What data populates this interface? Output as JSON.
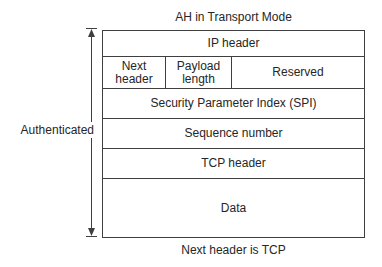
{
  "title": "AH in Transport Mode",
  "side_label": "Authenticated",
  "caption": "Next header is TCP",
  "packet": {
    "rows": {
      "ip_header": "IP header",
      "spi": "Security Parameter Index (SPI)",
      "sequence_number": "Sequence number",
      "tcp_header": "TCP header",
      "data": "Data"
    },
    "ah_fields": [
      {
        "label": "Next header"
      },
      {
        "label": "Payload length"
      },
      {
        "label": "Reserved"
      }
    ]
  },
  "colors": {
    "line": "#3f3f3f",
    "text": "#262626",
    "background": "#ffffff"
  }
}
